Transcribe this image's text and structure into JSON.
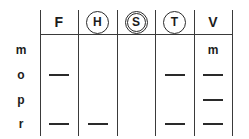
{
  "figure": {
    "kind": "grid-table",
    "background_color": "#ffffff",
    "line_color": "#3a3a3a",
    "ink_color": "#2a2a2a"
  },
  "columns": [
    {
      "key": "F",
      "label": "F",
      "circled": false,
      "double_circled": false,
      "x": 40,
      "width": 38
    },
    {
      "key": "H",
      "label": "H",
      "circled": true,
      "double_circled": false,
      "x": 78,
      "width": 39
    },
    {
      "key": "S",
      "label": "S",
      "circled": true,
      "double_circled": true,
      "x": 117,
      "width": 38
    },
    {
      "key": "T",
      "label": "T",
      "circled": true,
      "double_circled": false,
      "x": 155,
      "width": 39
    },
    {
      "key": "V",
      "label": "V",
      "circled": false,
      "double_circled": false,
      "x": 194,
      "width": 38
    }
  ],
  "vertical_rules_x": [
    40,
    78,
    117,
    155,
    194,
    232
  ],
  "horizontal_rule": {
    "x": 40,
    "y": 34,
    "width": 192
  },
  "rows": [
    {
      "label": "m",
      "y": 40,
      "cells": [
        {
          "column": "F",
          "mark": "",
          "type": "empty"
        },
        {
          "column": "H",
          "mark": "",
          "type": "empty"
        },
        {
          "column": "S",
          "mark": "",
          "type": "empty"
        },
        {
          "column": "T",
          "mark": "",
          "type": "empty"
        },
        {
          "column": "V",
          "mark": "m",
          "type": "text"
        }
      ]
    },
    {
      "label": "o",
      "y": 65,
      "cells": [
        {
          "column": "F",
          "mark": "—",
          "type": "dash"
        },
        {
          "column": "H",
          "mark": "",
          "type": "empty"
        },
        {
          "column": "S",
          "mark": "",
          "type": "empty"
        },
        {
          "column": "T",
          "mark": "—",
          "type": "dash"
        },
        {
          "column": "V",
          "mark": "—",
          "type": "dash"
        }
      ]
    },
    {
      "label": "p",
      "y": 90,
      "cells": [
        {
          "column": "F",
          "mark": "",
          "type": "empty"
        },
        {
          "column": "H",
          "mark": "",
          "type": "empty"
        },
        {
          "column": "S",
          "mark": "",
          "type": "empty"
        },
        {
          "column": "T",
          "mark": "",
          "type": "empty"
        },
        {
          "column": "V",
          "mark": "—",
          "type": "dash"
        }
      ]
    },
    {
      "label": "r",
      "y": 114,
      "cells": [
        {
          "column": "F",
          "mark": "—",
          "type": "dash"
        },
        {
          "column": "H",
          "mark": "—",
          "type": "dash"
        },
        {
          "column": "S",
          "mark": "",
          "type": "empty"
        },
        {
          "column": "T",
          "mark": "—",
          "type": "dash"
        },
        {
          "column": "V",
          "mark": "—",
          "type": "dash"
        }
      ]
    }
  ]
}
